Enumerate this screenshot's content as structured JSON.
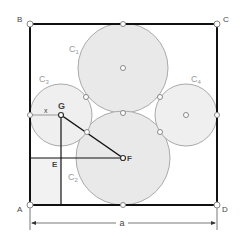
{
  "diagram": {
    "points": {
      "A": "A",
      "B": "B",
      "C": "C",
      "D": "D",
      "E": "E",
      "F": "F",
      "G": "G"
    },
    "circles": {
      "c1": {
        "label": "C",
        "sub": "1"
      },
      "c2": {
        "label": "C",
        "sub": "2"
      },
      "c3": {
        "label": "C",
        "sub": "3"
      },
      "c4": {
        "label": "C",
        "sub": "4"
      }
    },
    "segment_x_label": "x",
    "dimension_label": "a",
    "colors": {
      "square_stroke": "#111111",
      "circle_fill": "#e9e9e9",
      "circle_stroke": "#aaaaaa",
      "construction": "#111111",
      "label": "#444444"
    }
  }
}
